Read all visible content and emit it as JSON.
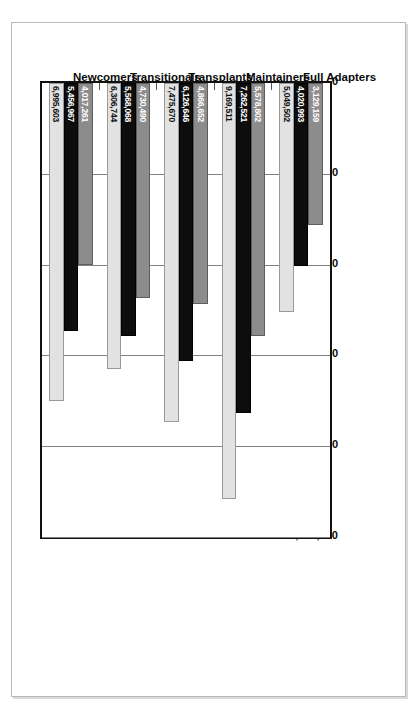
{
  "chart_data": {
    "type": "bar",
    "orientation": "vertical-rotated",
    "title": "",
    "xlabel": "",
    "ylabel": "",
    "ylim": [
      0,
      10000000
    ],
    "grid": true,
    "legend_position": "bottom-right",
    "legend_title": "Legend",
    "categories": [
      "Full Adapters",
      "Maintainers",
      "Transplants",
      "Transitionals",
      "Newcomers"
    ],
    "series": [
      {
        "name": "2000",
        "color": "#8c8c8c",
        "values": [
          3129159,
          5578802,
          4866652,
          4730490,
          4017261
        ]
      },
      {
        "name": "2004",
        "color": "#0d0d0d",
        "values": [
          4020993,
          7262521,
          6126646,
          5568068,
          5456967
        ]
      },
      {
        "name": "2009",
        "color": "#e2e2e2",
        "values": [
          5049502,
          9169511,
          7475670,
          6306744,
          6995603
        ]
      }
    ],
    "value_labels": [
      [
        "3,129,159",
        "4,020,993",
        "5,049,502"
      ],
      [
        "5,578,802",
        "7,262,521",
        "9,169,511"
      ],
      [
        "4,866,652",
        "6,126,646",
        "7,475,670"
      ],
      [
        "4,730,490",
        "5,568,068",
        "6,306,744"
      ],
      [
        "4,017,261",
        "5,456,967",
        "6,995,603"
      ]
    ],
    "axis_ticks": [
      "0",
      "2,000,000",
      "4,000,000",
      "6,000,000",
      "8,000,000",
      "10,000,000"
    ],
    "axis_tick_values": [
      0,
      2000000,
      4000000,
      6000000,
      8000000,
      10000000
    ]
  },
  "legend": {
    "title": "Legend",
    "entries": [
      {
        "label": "2000",
        "color": "#8c8c8c"
      },
      {
        "label": "2004",
        "color": "#0d0d0d"
      },
      {
        "label": "2009",
        "color": "#e2e2e2"
      }
    ]
  }
}
